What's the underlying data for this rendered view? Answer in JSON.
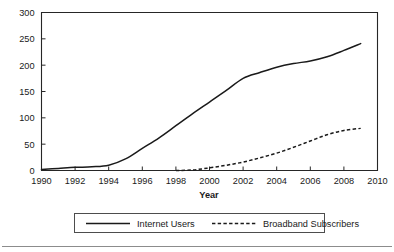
{
  "chart_data": {
    "type": "line",
    "title": "",
    "subtitle": "",
    "xlabel": "Year",
    "ylabel": "",
    "xlim": [
      1990,
      2010
    ],
    "ylim": [
      0,
      300
    ],
    "grid": false,
    "legend_position": "bottom-center",
    "x_ticks": [
      "1990",
      "1992",
      "1994",
      "1996",
      "1998",
      "2000",
      "2002",
      "2004",
      "2006",
      "2008",
      "2010"
    ],
    "x_tick_values": [
      1990,
      1992,
      1994,
      1996,
      1998,
      2000,
      2002,
      2004,
      2006,
      2008,
      2010
    ],
    "y_ticks": [
      "0",
      "50",
      "100",
      "150",
      "200",
      "250",
      "300"
    ],
    "y_tick_values": [
      0,
      50,
      100,
      150,
      200,
      250,
      300
    ],
    "x": [
      1990,
      1991,
      1992,
      1993,
      1994,
      1995,
      1996,
      1997,
      1998,
      1999,
      2000,
      2001,
      2002,
      2003,
      2004,
      2005,
      2006,
      2007,
      2008,
      2009
    ],
    "series": [
      {
        "name": "Internet Users",
        "style": "solid",
        "values": [
          2,
          4,
          6,
          7,
          10,
          22,
          42,
          62,
          85,
          108,
          130,
          152,
          175,
          186,
          196,
          203,
          208,
          216,
          228,
          241
        ]
      },
      {
        "name": "Broadband Subscribers",
        "style": "dashed",
        "x": [
          1998,
          1999,
          2000,
          2001,
          2002,
          2003,
          2004,
          2005,
          2006,
          2007,
          2008,
          2009
        ],
        "values": [
          0,
          1,
          5,
          10,
          16,
          24,
          33,
          44,
          56,
          68,
          76,
          80
        ]
      }
    ]
  },
  "axis": {
    "x_title": "Year"
  },
  "legend": {
    "entries": [
      {
        "label": "Internet Users",
        "style": "solid"
      },
      {
        "label": "Broadband Subscribers",
        "style": "dashed"
      }
    ]
  }
}
